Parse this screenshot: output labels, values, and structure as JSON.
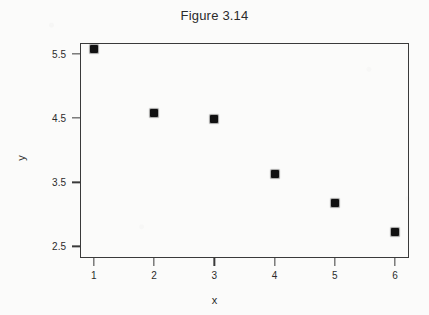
{
  "chart_data": {
    "type": "scatter",
    "title": "Figure 3.14",
    "xlabel": "x",
    "ylabel": "y",
    "x": [
      1,
      2,
      3,
      4,
      5,
      6
    ],
    "values": [
      5.57,
      4.58,
      4.48,
      3.63,
      3.17,
      2.72
    ],
    "series": [
      {
        "name": "data",
        "points": [
          {
            "x": 1,
            "y": 5.57
          },
          {
            "x": 2,
            "y": 4.58
          },
          {
            "x": 3,
            "y": 4.48
          },
          {
            "x": 4,
            "y": 3.63
          },
          {
            "x": 5,
            "y": 3.17
          },
          {
            "x": 6,
            "y": 2.72
          }
        ]
      }
    ],
    "xlim": [
      0.77,
      6.23
    ],
    "ylim": [
      2.32,
      5.67
    ],
    "xticks": [
      1,
      2,
      3,
      4,
      5,
      6
    ],
    "xticklabels": [
      "1",
      "2",
      "3",
      "4",
      "5",
      "6"
    ],
    "yticks": [
      2.5,
      3.5,
      4.5,
      5.5
    ],
    "yticklabels": [
      "2.5",
      "3.5",
      "4.5",
      "5.5"
    ],
    "grid": false,
    "legend": null,
    "marker": "filled-square",
    "marker_color": "#111111",
    "frame_color": "#3a3a3a",
    "background_color": "#fbfbfa"
  }
}
